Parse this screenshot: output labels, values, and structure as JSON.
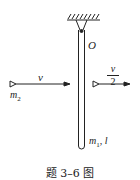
{
  "diagram": {
    "pivot_label": "O",
    "left_velocity": "v",
    "right_velocity_num": "v",
    "right_velocity_den": "2",
    "ball_label": "m",
    "ball_sub": "2",
    "rod_label": "m",
    "rod_sub": "1",
    "rod_length": ", l",
    "caption": "题 3–6 图"
  }
}
